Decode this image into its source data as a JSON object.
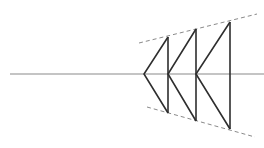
{
  "diagram": {
    "canvas": {
      "width": 264,
      "height": 148,
      "background": "#ffffff"
    },
    "colors": {
      "axis": "#8a8a8a",
      "chevron": "#2e2e2e",
      "guide": "#8a8a8a"
    },
    "axis_line": {
      "x1": 10,
      "y1": 74,
      "x2": 264,
      "y2": 74
    },
    "chevrons": [
      {
        "tip": [
          144,
          74
        ],
        "top": [
          168,
          37
        ],
        "bottom": [
          168,
          113
        ]
      },
      {
        "tip": [
          168,
          74
        ],
        "top": [
          196,
          29
        ],
        "bottom": [
          196,
          121
        ]
      },
      {
        "tip": [
          196,
          74
        ],
        "top": [
          230,
          22
        ],
        "bottom": [
          230,
          129
        ]
      }
    ],
    "guides": {
      "top": {
        "x1": 139,
        "y1": 43,
        "x2": 257,
        "y2": 14
      },
      "bottom": {
        "x1": 147,
        "y1": 107,
        "x2": 255,
        "y2": 137
      }
    }
  }
}
